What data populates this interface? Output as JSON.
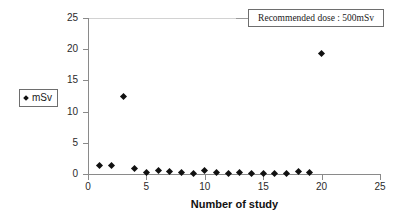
{
  "chart_data": {
    "type": "scatter",
    "title": "",
    "xlabel": "Number of study",
    "ylabel": "",
    "xlim": [
      0,
      25
    ],
    "ylim": [
      0,
      25
    ],
    "xticks": [
      0,
      5,
      10,
      15,
      20,
      25
    ],
    "yticks": [
      0,
      5,
      10,
      15,
      20,
      25
    ],
    "grid": false,
    "legend_position": "left-outside",
    "series": [
      {
        "name": "mSv",
        "marker": "diamond",
        "color": "#111111",
        "x": [
          1,
          2,
          3,
          4,
          5,
          6,
          7,
          8,
          9,
          10,
          11,
          12,
          13,
          14,
          15,
          16,
          17,
          18,
          19,
          20
        ],
        "values": [
          1.3,
          1.3,
          12.4,
          0.9,
          0.3,
          0.6,
          0.45,
          0.25,
          0.15,
          0.5,
          0.25,
          0.15,
          0.2,
          0.15,
          0.15,
          0.15,
          0.15,
          0.45,
          0.2,
          19.3
        ]
      }
    ],
    "annotations": [
      {
        "name": "recommended-dose-callout",
        "text": "Recommended dose : 500mSv"
      }
    ]
  },
  "legend": {
    "entries": [
      {
        "label": "mSv",
        "marker_icon": "diamond-marker-icon"
      }
    ]
  },
  "axes": {
    "x_title": "Number of study",
    "x_tick_labels": [
      "0",
      "5",
      "10",
      "15",
      "20",
      "25"
    ],
    "y_tick_labels": [
      "0",
      "5",
      "10",
      "15",
      "20",
      "25"
    ]
  }
}
